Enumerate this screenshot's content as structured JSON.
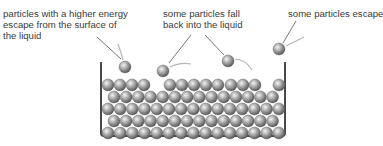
{
  "labels": {
    "escape_surface": [
      "particles with a higher energy",
      "escape from the surface of",
      "the liquid"
    ],
    "fall_back": [
      "some particles fall",
      "back into the liquid"
    ],
    "escape": [
      "some particles escape"
    ]
  },
  "colors": {
    "text": "#3a3a3a",
    "container": "#4a4a4a",
    "particle_light": "#f2f2f2",
    "particle_mid": "#9a9a9a",
    "particle_dark": "#555555",
    "arrow": "#b0b0b0",
    "leader": "#555555"
  },
  "container": {
    "left": 101,
    "top": 62,
    "right": 285,
    "bottom": 136
  },
  "particle_radius": 6,
  "rows": [
    {
      "y": 133,
      "x_start": 108,
      "count": 15,
      "step": 12.2
    },
    {
      "y": 121,
      "x_start": 114,
      "count": 14,
      "step": 12.2
    },
    {
      "y": 109,
      "x_start": 108,
      "count": 15,
      "step": 12.2
    },
    {
      "y": 97,
      "x_start": 114,
      "count": 14,
      "step": 12.2
    }
  ],
  "top_row": [
    108,
    120,
    132,
    144,
    170,
    182,
    194,
    206,
    218,
    231,
    243,
    255,
    279
  ],
  "top_row_y": 85,
  "free_particles": [
    {
      "x": 125,
      "y": 67,
      "role": "escaping"
    },
    {
      "x": 163,
      "y": 71,
      "role": "falling-back"
    },
    {
      "x": 228,
      "y": 61,
      "role": "falling-back"
    },
    {
      "x": 279,
      "y": 49,
      "role": "escaping"
    }
  ]
}
